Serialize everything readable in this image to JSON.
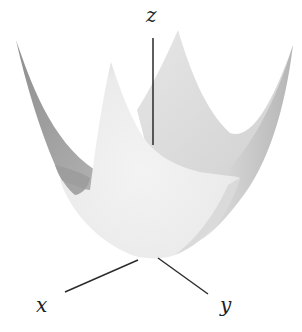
{
  "figure": {
    "axes": {
      "x": {
        "label": "x"
      },
      "y": {
        "label": "y"
      },
      "z": {
        "label": "z"
      }
    },
    "colors": {
      "background": "#ffffff",
      "surface_front": "#ececec",
      "surface_inner_back": "#dcdcdc",
      "surface_inner_dark": "#9a9a9a",
      "surface_shadow": "#bdbdbd",
      "axis_line": "#2a2a2a"
    }
  }
}
